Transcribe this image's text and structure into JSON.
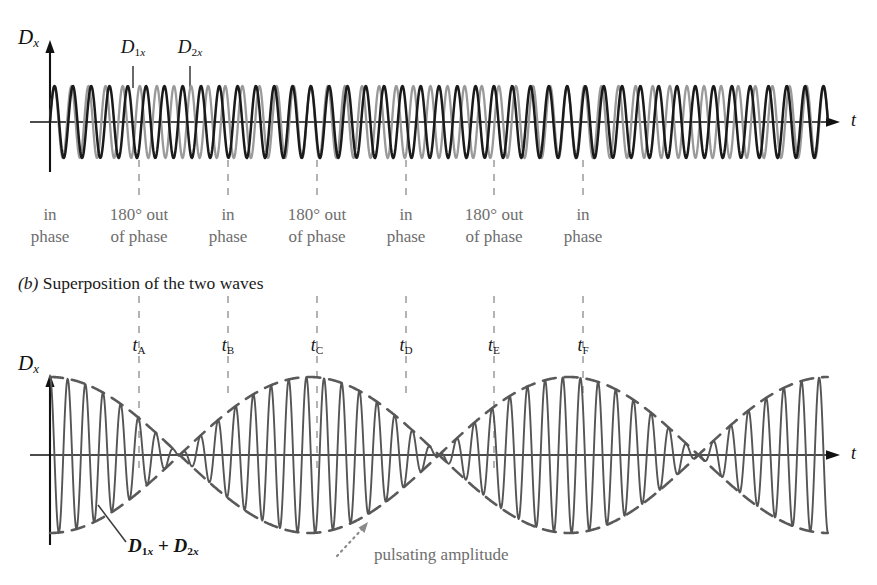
{
  "figure": {
    "panel_a": {
      "y_axis_label": "D",
      "y_axis_sub": "x",
      "t_axis_label": "t",
      "wave1_label": "D",
      "wave1_sub": "1x",
      "wave2_label": "D",
      "wave2_sub": "2x",
      "phase_labels": [
        {
          "line1": "in",
          "line2": "phase"
        },
        {
          "line1": "180° out",
          "line2": "of phase"
        },
        {
          "line1": "in",
          "line2": "phase"
        },
        {
          "line1": "180° out",
          "line2": "of phase"
        },
        {
          "line1": "in",
          "line2": "phase"
        },
        {
          "line1": "180° out",
          "line2": "of phase"
        },
        {
          "line1": "in",
          "line2": "phase"
        }
      ]
    },
    "panel_b": {
      "caption_prefix": "(b)",
      "caption_text": "Superposition of the two waves",
      "y_axis_label": "D",
      "y_axis_sub": "x",
      "t_axis_label": "t",
      "time_marks": [
        {
          "base": "t",
          "sub": "A"
        },
        {
          "base": "t",
          "sub": "B"
        },
        {
          "base": "t",
          "sub": "C"
        },
        {
          "base": "t",
          "sub": "D"
        },
        {
          "base": "t",
          "sub": "E"
        },
        {
          "base": "t",
          "sub": "F"
        }
      ],
      "sum_label_d": "D",
      "sum_label_sub1": "1x",
      "sum_label_op": "+",
      "sum_label_sub2": "2x",
      "annotation": "pulsating amplitude"
    },
    "colors": {
      "wave1_grey": "#9a9a9a",
      "wave2_black": "#1a1a1a",
      "sum_wave": "#555555",
      "envelope": "#5a5a5a",
      "axis": "#111111",
      "dashed_guide": "#9b9b9b",
      "annotation_grey": "#6e6e6e"
    }
  },
  "chart_data": {
    "type": "line",
    "xlabel": "t",
    "ylabel": "D_x",
    "grid": false,
    "legend_position": "inline-callouts",
    "panels": [
      {
        "name": "panel_a",
        "description": "Two sinusoidal waves D_1x and D_2x of slightly different frequency plotted on the same time axis",
        "series": [
          {
            "name": "D_1x",
            "color": "#9a9a9a",
            "amplitude": 1.0,
            "cycles_across_axis": 45.5,
            "phase_deg": 0
          },
          {
            "name": "D_2x",
            "color": "#1a1a1a",
            "amplitude": 1.0,
            "cycles_across_axis": 42.5,
            "phase_deg": 0
          }
        ],
        "guide_lines_x": [
          139,
          228,
          317,
          406,
          494,
          583
        ],
        "phase_label_x": [
          50,
          139,
          228,
          317,
          406,
          494,
          583
        ],
        "axis_y_px": 122,
        "amplitude_px": 36
      },
      {
        "name": "panel_b",
        "description": "Superposition D_1x + D_2x showing beats with a pulsating amplitude envelope",
        "series": [
          {
            "name": "D_1x + D_2x",
            "color": "#555555",
            "carrier_cycles": 44,
            "beat_cycles": 3,
            "amplitude": 2.0
          }
        ],
        "envelope": {
          "name": "pulsating amplitude",
          "style": "dashed",
          "color": "#5a5a5a",
          "beat_cycles": 3
        },
        "guide_lines_x": [
          139,
          228,
          317,
          406,
          494,
          583
        ],
        "time_mark_x": [
          139,
          228,
          317,
          406,
          494,
          583
        ],
        "axis_y_px": 455,
        "amplitude_px": 78,
        "beat_nodes_x": [
          139,
          317,
          494
        ],
        "beat_antinodes_x": [
          50,
          228,
          406,
          583
        ]
      }
    ]
  }
}
